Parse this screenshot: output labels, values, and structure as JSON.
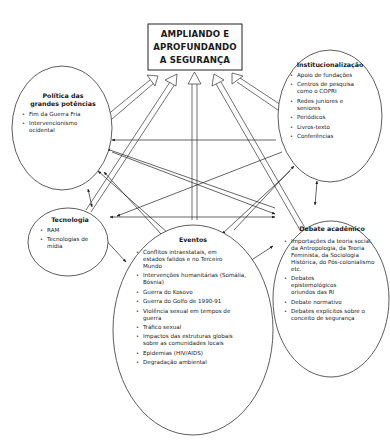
{
  "title_box": {
    "lines": [
      "AMPLIANDO E",
      "APROFUNDANDO",
      "A SEGURANÇA"
    ]
  },
  "nodes": {
    "politica": {
      "title_lines": [
        "Política das",
        "grandes potências"
      ],
      "items": [
        "Fim da Guerra Fria",
        "Intervencionismo ocidental"
      ]
    },
    "institucionalizacao": {
      "title": "Institucionalização",
      "items": [
        "Apoio de fundações",
        "Centros de pesquisa como o COPRI",
        "Redes juniores e seniores",
        "Periódicos",
        "Livros-texto",
        "Conferências"
      ]
    },
    "tecnologia": {
      "title": "Tecnologia",
      "items": [
        "RAM",
        "Tecnologias de mídia"
      ]
    },
    "debate": {
      "title": "Debate acadêmico",
      "items": [
        "Importações da teoria social, da Antropologia, da Teoria Feminista, da Sociologia Histórica, do Pós-colonialismo etc.",
        "Debates epistemológicos oriundos das RI",
        "Debate normativo",
        "Debates explícitos sobre o conceito de segurança"
      ]
    },
    "eventos": {
      "title": "Eventos",
      "items": [
        "Conflitos intraestatais, em estados falidos e no Terceiro Mundo",
        "Intervenções humanitárias (Somália, Bósnia)",
        "Guerra do Kosovo",
        "Guerra do Golfo de 1990-91",
        "Violência sexual em tempos de guerra",
        "Tráfico sexual",
        "Impactos das estruturas globais sobre as comunidades locais",
        "Epidemias (HIV/AIDS)",
        "Degradação ambiental"
      ]
    }
  },
  "colors": {
    "stroke": "#333333",
    "background": "#ffffff",
    "text": "#1a1a1a"
  }
}
